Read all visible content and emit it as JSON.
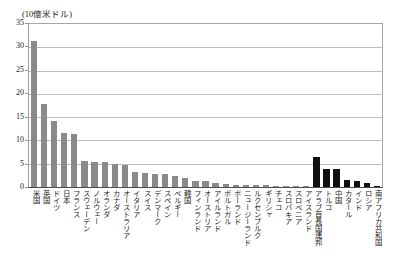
{
  "chart_data": {
    "type": "bar",
    "title": "(10億米ドル)",
    "subtitle": "",
    "xlabel": "",
    "ylabel": "",
    "ylim": [
      0,
      35
    ],
    "yticks": [
      0,
      5,
      10,
      15,
      20,
      25,
      30,
      35
    ],
    "grid": true,
    "legend": false,
    "categories": [
      "米国",
      "英国",
      "ドイツ",
      "日本",
      "フランス",
      "スウェーデン",
      "ノルウェー",
      "オランダ",
      "カナダ",
      "オーストラリア",
      "イタリア",
      "スイス",
      "デンマーク",
      "スペイン",
      "ベルギー",
      "韓国",
      "フィンランド",
      "オーストリア",
      "アイルランド",
      "ポルトガル",
      "ポーランド",
      "ニュージーランド",
      "ルクセンブルク",
      "ギリシャ",
      "チェコ",
      "スロバキア",
      "スロベニア",
      "アイスランド",
      "アラブ首長国連邦",
      "トルコ",
      "中国",
      "カタール",
      "インド",
      "ロシア",
      "南アフリカ共和国"
    ],
    "values": [
      31.5,
      17.9,
      14.2,
      11.6,
      11.4,
      5.6,
      5.4,
      5.3,
      5.0,
      4.8,
      3.3,
      3.1,
      2.9,
      2.8,
      2.3,
      1.9,
      1.3,
      1.2,
      0.9,
      0.6,
      0.5,
      0.45,
      0.4,
      0.35,
      0.25,
      0.2,
      0.15,
      0.1,
      6.5,
      4.0,
      3.8,
      1.5,
      1.3,
      0.8,
      0.2
    ],
    "series_colors": {
      "oecd": "#8a8a8a",
      "non_oecd": "#101010"
    },
    "dark_from_index": 28
  }
}
